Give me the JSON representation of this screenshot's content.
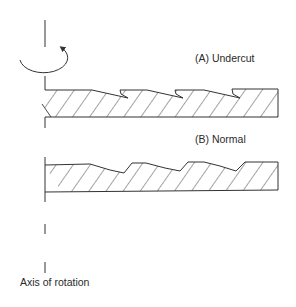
{
  "diagram": {
    "labels": {
      "undercut": "(A) Undercut",
      "normal": "(B) Normal",
      "axis": "Axis of rotation"
    },
    "colors": {
      "line": "#333333",
      "background": "#ffffff"
    },
    "elements": [
      {
        "id": "axis-of-rotation",
        "type": "dashed-vertical-line"
      },
      {
        "id": "rotation-arrow",
        "type": "curved-arrow"
      },
      {
        "id": "profile-a",
        "label": "(A) Undercut",
        "type": "hatched-sawtooth-profile"
      },
      {
        "id": "profile-b",
        "label": "(B) Normal",
        "type": "hatched-sawtooth-profile"
      }
    ]
  }
}
